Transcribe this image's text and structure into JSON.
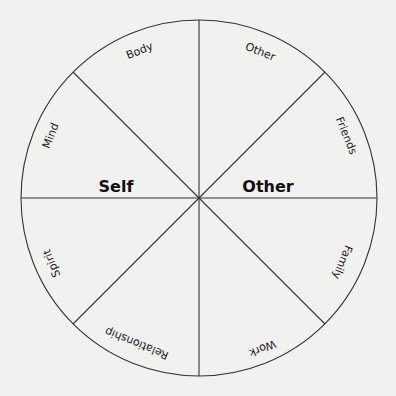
{
  "diagram": {
    "type": "segmented-wheel",
    "halves": {
      "left": "Self",
      "right": "Other"
    },
    "segments": [
      {
        "label": "Body"
      },
      {
        "label": "Other"
      },
      {
        "label": "Friends"
      },
      {
        "label": "Family"
      },
      {
        "label": "Work"
      },
      {
        "label": "Relationship"
      },
      {
        "label": "Spirit"
      },
      {
        "label": "Mind"
      }
    ]
  }
}
